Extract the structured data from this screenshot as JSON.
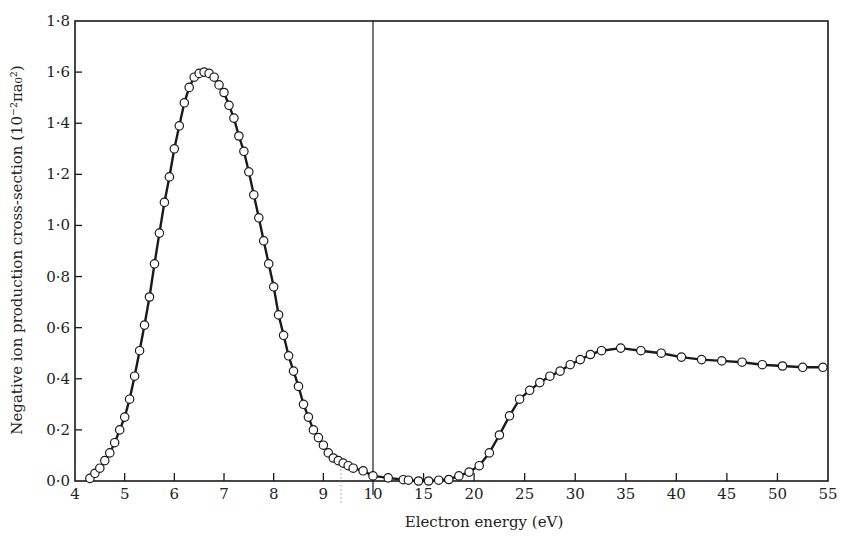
{
  "chart_data": {
    "type": "line",
    "title": "",
    "xlabel": "Electron energy (eV)",
    "ylabel": "Negative ion production cross-section (10⁻²πa₀²)",
    "ylim": [
      0,
      1.8
    ],
    "xlim": [
      4,
      55
    ],
    "x_scale_note": "broken scale: 4-10 eV expanded, 10-55 eV compressed; vertical line at 10 eV",
    "grid": false,
    "legend": null,
    "markers": "open circles connected by solid line",
    "y_ticks": [
      "0·0",
      "0·2",
      "0·4",
      "0·6",
      "0·8",
      "1·0",
      "1·2",
      "1·4",
      "1·6",
      "1·8"
    ],
    "y_tick_values": [
      0,
      0.2,
      0.4,
      0.6,
      0.8,
      1.0,
      1.2,
      1.4,
      1.6,
      1.8
    ],
    "x_ticks": [
      "4",
      "5",
      "6",
      "7",
      "8",
      "9",
      "10",
      "15",
      "20",
      "25",
      "30",
      "35",
      "40",
      "45",
      "50",
      "55"
    ],
    "x_tick_values": [
      4,
      5,
      6,
      7,
      8,
      9,
      10,
      15,
      20,
      25,
      30,
      35,
      40,
      45,
      50,
      55
    ],
    "series": [
      {
        "name": "Negative ion production cross-section",
        "x": [
          4.3,
          4.4,
          4.5,
          4.6,
          4.7,
          4.8,
          4.9,
          5.0,
          5.1,
          5.2,
          5.3,
          5.4,
          5.5,
          5.6,
          5.7,
          5.8,
          5.9,
          6.0,
          6.1,
          6.2,
          6.3,
          6.4,
          6.5,
          6.6,
          6.7,
          6.8,
          6.9,
          7.0,
          7.1,
          7.2,
          7.3,
          7.4,
          7.5,
          7.6,
          7.7,
          7.8,
          7.9,
          8.0,
          8.1,
          8.2,
          8.3,
          8.4,
          8.5,
          8.6,
          8.7,
          8.8,
          8.9,
          9.0,
          9.1,
          9.2,
          9.3,
          9.4,
          9.5,
          9.6,
          9.8,
          10.0,
          11.5,
          13.0,
          13.5,
          14.5,
          15.5,
          16.5,
          17.5,
          18.5,
          19.5,
          20.5,
          21.5,
          22.5,
          23.5,
          24.5,
          25.5,
          26.5,
          27.5,
          28.5,
          29.5,
          30.5,
          31.5,
          32.6,
          34.5,
          36.5,
          38.5,
          40.5,
          42.5,
          44.5,
          46.5,
          48.5,
          50.5,
          52.5,
          54.5
        ],
        "values": [
          0.01,
          0.03,
          0.05,
          0.08,
          0.11,
          0.15,
          0.2,
          0.25,
          0.32,
          0.41,
          0.51,
          0.61,
          0.72,
          0.85,
          0.97,
          1.09,
          1.19,
          1.3,
          1.39,
          1.48,
          1.54,
          1.58,
          1.595,
          1.6,
          1.595,
          1.58,
          1.55,
          1.52,
          1.47,
          1.42,
          1.35,
          1.29,
          1.21,
          1.12,
          1.03,
          0.94,
          0.85,
          0.76,
          0.65,
          0.57,
          0.49,
          0.43,
          0.37,
          0.3,
          0.25,
          0.2,
          0.17,
          0.14,
          0.11,
          0.09,
          0.08,
          0.07,
          0.06,
          0.05,
          0.04,
          0.02,
          0.012,
          0.005,
          0.003,
          0.0,
          0.0,
          0.003,
          0.006,
          0.02,
          0.035,
          0.06,
          0.11,
          0.18,
          0.255,
          0.32,
          0.355,
          0.385,
          0.41,
          0.43,
          0.455,
          0.475,
          0.495,
          0.51,
          0.52,
          0.51,
          0.5,
          0.485,
          0.475,
          0.47,
          0.465,
          0.455,
          0.45,
          0.445,
          0.445
        ]
      }
    ],
    "annotations": [
      "vertical divider line at 10 eV marking change of x-axis scale",
      "faint dotted mark near 9.4 eV"
    ]
  },
  "layout": {
    "plot_left": 75,
    "plot_right": 828,
    "plot_top": 21,
    "plot_bottom": 481,
    "x_break_value": 10,
    "x_break_px": 373,
    "seg1_px_per_unit": 49.67,
    "seg2_px_per_unit": 10.111,
    "y_px_per_unit": 255.56
  },
  "colors": {
    "ink": "#1a1a1a",
    "background": "#ffffff",
    "marker_fill": "#ffffff"
  }
}
